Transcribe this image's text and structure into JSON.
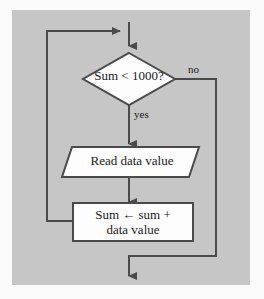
{
  "figure": {
    "type": "flowchart",
    "background_color": "#c6c6c6",
    "page_color": "#fbfbfb",
    "line_color": "#4a4a4a",
    "shape_fill": "#fdfdfd",
    "shape_stroke": "#4a4a4a",
    "text_color": "#1a1a1a"
  },
  "nodes": {
    "decision": {
      "shape": "diamond",
      "label": "Sum < 1000?"
    },
    "input": {
      "shape": "parallelogram",
      "label": "Read data value"
    },
    "process": {
      "shape": "rectangle",
      "label_line1": "Sum ← sum +",
      "label_line2": "data value"
    }
  },
  "edges": {
    "no_label": "no",
    "yes_label": "yes"
  }
}
